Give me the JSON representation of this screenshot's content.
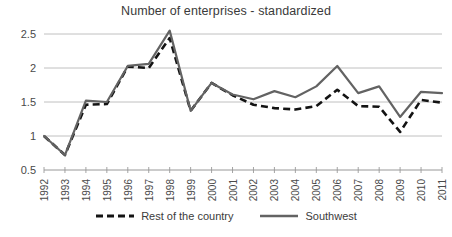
{
  "chart_data": {
    "type": "line",
    "title": "Number of enterprises - standardized",
    "xlabel": "",
    "ylabel": "",
    "x": [
      1992,
      1993,
      1994,
      1995,
      1996,
      1997,
      1998,
      1999,
      2000,
      2001,
      2002,
      2003,
      2004,
      2005,
      2006,
      2007,
      2008,
      2009,
      2010,
      2011
    ],
    "categories": [
      "1992",
      "1993",
      "1994",
      "1995",
      "1996",
      "1997",
      "1998",
      "1999",
      "2000",
      "2001",
      "2002",
      "2003",
      "2004",
      "2005",
      "2006",
      "2007",
      "2008",
      "2009",
      "2010",
      "2011"
    ],
    "series": [
      {
        "name": "Rest of the country",
        "style": "dashed",
        "color": "#131313",
        "values": [
          1.0,
          0.72,
          1.46,
          1.47,
          2.02,
          2.0,
          2.44,
          1.37,
          1.78,
          1.6,
          1.46,
          1.41,
          1.39,
          1.44,
          1.68,
          1.44,
          1.43,
          1.06,
          1.53,
          1.49
        ]
      },
      {
        "name": "Southwest",
        "style": "solid",
        "color": "#636363",
        "values": [
          1.0,
          0.72,
          1.52,
          1.5,
          2.03,
          2.06,
          2.55,
          1.37,
          1.78,
          1.61,
          1.54,
          1.66,
          1.57,
          1.73,
          2.03,
          1.63,
          1.73,
          1.28,
          1.65,
          1.63
        ]
      }
    ],
    "ylim": [
      0.5,
      2.5
    ],
    "y_ticks": [
      "0.5",
      "1",
      "1.5",
      "2",
      "2.5"
    ],
    "y_tick_values": [
      0.5,
      1,
      1.5,
      2,
      2.5
    ],
    "xlim": [
      1992,
      2011
    ],
    "grid": "horizontal",
    "legend_position": "bottom"
  },
  "legend": {
    "entries": [
      {
        "label": "Rest of the country",
        "icon": "dashed-line-swatch"
      },
      {
        "label": "Southwest",
        "icon": "solid-line-swatch"
      }
    ]
  }
}
